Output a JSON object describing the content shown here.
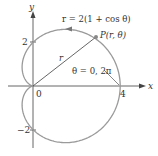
{
  "figure": {
    "equation_label": "r = 2(1 + cos θ)",
    "point_label": "P(r, θ)",
    "radius_label": "r",
    "angle_label": "θ = 0, 2π",
    "axes": {
      "x_label": "x",
      "y_label": "y",
      "origin_label": "0",
      "x_tick_label": "4",
      "y_tick_pos_label": "2",
      "y_tick_neg_label": "−2"
    },
    "colors": {
      "curve": "#9a9a9a",
      "axes": "#444444",
      "text": "#333333"
    }
  },
  "chart_data": {
    "type": "line",
    "xlabel": "x",
    "ylabel": "y",
    "xlim": [
      -0.6,
      5
    ],
    "ylim": [
      -3,
      3.2
    ],
    "x_ticks": [
      0,
      4
    ],
    "y_ticks": [
      -2,
      2
    ],
    "series": [
      {
        "name": "r = 2(1 + cos θ)",
        "polar": true,
        "theta_range": [
          0,
          6.2832
        ]
      }
    ],
    "annotations": [
      "P(r, θ)",
      "θ = 0, 2π",
      "r"
    ]
  }
}
